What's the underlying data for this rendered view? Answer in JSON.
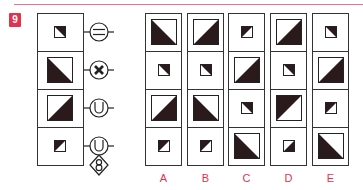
{
  "question": {
    "number": "9",
    "accent_color": "#e0334f",
    "line_color": "#e8758d"
  },
  "sequence": {
    "cells": [
      {
        "size": "small",
        "dark_corner": "tr",
        "symbol": "circle-equals"
      },
      {
        "size": "large",
        "dark_corner": "bl",
        "symbol": "circle-x"
      },
      {
        "size": "large",
        "dark_corner": "br",
        "symbol": "circle-u"
      },
      {
        "size": "small",
        "dark_corner": "tl",
        "symbol": "circle-u-with-diamond-8"
      }
    ]
  },
  "options": [
    {
      "label": "A",
      "cells": [
        {
          "size": "large",
          "dark_corner": "bl"
        },
        {
          "size": "small",
          "dark_corner": "tr"
        },
        {
          "size": "large",
          "dark_corner": "br"
        },
        {
          "size": "small",
          "dark_corner": "tl"
        }
      ]
    },
    {
      "label": "B",
      "cells": [
        {
          "size": "large",
          "dark_corner": "br"
        },
        {
          "size": "small",
          "dark_corner": "tr"
        },
        {
          "size": "large",
          "dark_corner": "bl"
        },
        {
          "size": "small",
          "dark_corner": "tl"
        }
      ]
    },
    {
      "label": "C",
      "cells": [
        {
          "size": "small",
          "dark_corner": "tl"
        },
        {
          "size": "large",
          "dark_corner": "br"
        },
        {
          "size": "small",
          "dark_corner": "tr"
        },
        {
          "size": "large",
          "dark_corner": "bl"
        }
      ]
    },
    {
      "label": "D",
      "cells": [
        {
          "size": "large",
          "dark_corner": "br"
        },
        {
          "size": "small",
          "dark_corner": "tr"
        },
        {
          "size": "large",
          "dark_corner": "tl"
        },
        {
          "size": "small",
          "dark_corner": "br"
        }
      ]
    },
    {
      "label": "E",
      "cells": [
        {
          "size": "small",
          "dark_corner": "tr"
        },
        {
          "size": "large",
          "dark_corner": "br"
        },
        {
          "size": "small",
          "dark_corner": "tl"
        },
        {
          "size": "large",
          "dark_corner": "bl"
        }
      ]
    }
  ]
}
